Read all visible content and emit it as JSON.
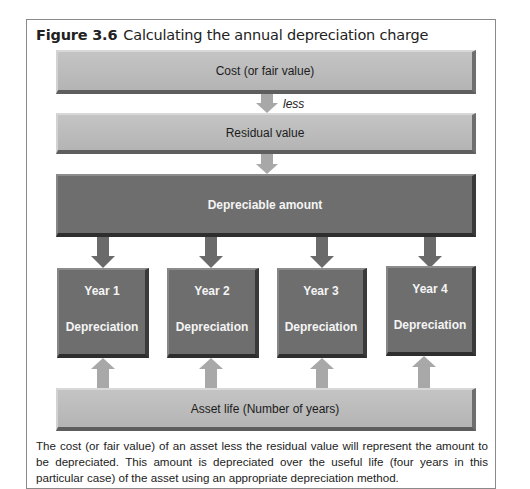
{
  "figure": {
    "number": "Figure 3.6",
    "title": "Calculating the annual depreciation charge"
  },
  "boxes": {
    "cost": "Cost (or fair value)",
    "residual": "Residual value",
    "depreciable": "Depreciable amount",
    "asset_life": "Asset life (Number of years)"
  },
  "connectors": {
    "less": "less",
    "equals": "equals"
  },
  "years": [
    {
      "year": "Year 1",
      "label": "Depreciation"
    },
    {
      "year": "Year 2",
      "label": "Depreciation"
    },
    {
      "year": "Year 3",
      "label": "Depreciation"
    },
    {
      "year": "Year 4",
      "label": "Depreciation"
    }
  ],
  "caption": "The cost (or fair value) of an asset less the residual value will represent the amount to be depreciated. This amount is depreciated over the useful life (four years in this particular case) of the asset using an appropriate depreciation method.",
  "colors": {
    "light_box": "#bcbcbc",
    "dark_box": "#6e6e6e",
    "light_arrow": "#a8a8a8",
    "dark_arrow": "#6a6a6a"
  }
}
